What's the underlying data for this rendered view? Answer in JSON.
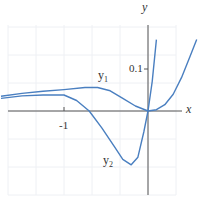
{
  "chart_data": {
    "type": "line",
    "title": "",
    "xlabel": "x",
    "ylabel": "y",
    "x_ticks": [
      {
        "value": -1,
        "label": "-1"
      }
    ],
    "y_ticks": [
      {
        "value": 0.1,
        "label": "0.1"
      }
    ],
    "xlim": [
      -1.75,
      0.72
    ],
    "ylim": [
      -0.15,
      0.17
    ],
    "grid": true,
    "legend": "inline labels",
    "series": [
      {
        "name": "y1",
        "label": "y₁",
        "color": "#4a7fc0",
        "points": [
          [
            -1.75,
            0.035
          ],
          [
            -1.5,
            0.042
          ],
          [
            -1.25,
            0.047
          ],
          [
            -1.0,
            0.051
          ],
          [
            -0.75,
            0.056
          ],
          [
            -0.6,
            0.056
          ],
          [
            -0.45,
            0.048
          ],
          [
            -0.3,
            0.03
          ],
          [
            -0.15,
            0.012
          ],
          [
            0.0,
            0.0
          ],
          [
            0.1,
            0.003
          ],
          [
            0.2,
            0.015
          ],
          [
            0.3,
            0.04
          ],
          [
            0.4,
            0.08
          ],
          [
            0.5,
            0.13
          ],
          [
            0.58,
            0.17
          ]
        ]
      },
      {
        "name": "y2",
        "label": "y₂",
        "color": "#4a7fc0",
        "points": [
          [
            -1.75,
            0.03
          ],
          [
            -1.5,
            0.036
          ],
          [
            -1.25,
            0.038
          ],
          [
            -1.0,
            0.038
          ],
          [
            -0.85,
            0.025
          ],
          [
            -0.7,
            0.0
          ],
          [
            -0.55,
            -0.04
          ],
          [
            -0.4,
            -0.085
          ],
          [
            -0.3,
            -0.115
          ],
          [
            -0.2,
            -0.128
          ],
          [
            -0.12,
            -0.11
          ],
          [
            -0.05,
            -0.05
          ],
          [
            0.0,
            0.0
          ],
          [
            0.05,
            0.07
          ],
          [
            0.1,
            0.17
          ]
        ]
      }
    ]
  },
  "labels": {
    "x_axis": "x",
    "y_axis": "y",
    "tick_x": "-1",
    "tick_y": "0.1",
    "y1": "y",
    "y1_sub": "1",
    "y2": "y",
    "y2_sub": "2"
  }
}
